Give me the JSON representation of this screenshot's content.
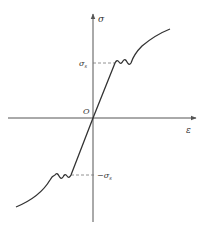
{
  "diagram": {
    "type": "stress-strain hysteresis (tension/compression)",
    "axes": {
      "y_label": "σ",
      "x_label": "ε",
      "origin_label": "O"
    },
    "markers": {
      "yield_positive": "σ",
      "yield_positive_sub": "s",
      "yield_negative": "−σ",
      "yield_negative_sub": "s"
    },
    "colors": {
      "line": "#333333",
      "axis": "#555555",
      "dashed": "#777777"
    }
  }
}
